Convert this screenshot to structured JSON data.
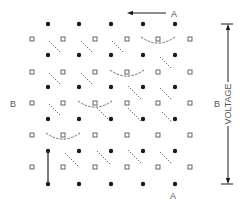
{
  "diagram": {
    "labels": {
      "top_arrow_label": "A",
      "bottom_label": "A",
      "left_label": "B",
      "right_label": "B",
      "voltage_label": "VOLTAGE"
    },
    "colors": {
      "ink": "#1a1a1a",
      "square_stroke": "#555555",
      "dash": "#555555",
      "label": "#555555"
    },
    "dots": {
      "xs": [
        48,
        79,
        111,
        143,
        175
      ],
      "ys": [
        24,
        55,
        87,
        119,
        151,
        184
      ]
    },
    "squares": {
      "xs": [
        32,
        63,
        95,
        127,
        158,
        190
      ],
      "ys": [
        39,
        72,
        103,
        135,
        167
      ]
    },
    "dashed_diagonals": [
      [
        49,
        41,
        61,
        53
      ],
      [
        81,
        41,
        93,
        53
      ],
      [
        112,
        41,
        124,
        53
      ],
      [
        160,
        57,
        172,
        69
      ],
      [
        49,
        73,
        61,
        85
      ],
      [
        81,
        73,
        93,
        85
      ],
      [
        128,
        86,
        142,
        100
      ],
      [
        160,
        88,
        172,
        100
      ],
      [
        49,
        104,
        61,
        116
      ],
      [
        97,
        108,
        111,
        122
      ],
      [
        128,
        108,
        142,
        122
      ],
      [
        162,
        112,
        172,
        122
      ],
      [
        65,
        153,
        79,
        167
      ],
      [
        97,
        151,
        111,
        165
      ],
      [
        128,
        150,
        142,
        164
      ],
      [
        160,
        152,
        172,
        164
      ]
    ],
    "arcs": [
      {
        "cx": 158,
        "cy": 38,
        "rx": 17,
        "ry": 7
      },
      {
        "cx": 127,
        "cy": 71,
        "rx": 17,
        "ry": 7
      },
      {
        "cx": 95,
        "cy": 102,
        "rx": 17,
        "ry": 7
      },
      {
        "cx": 63,
        "cy": 134,
        "rx": 17,
        "ry": 7
      }
    ],
    "top_arrow": {
      "x1": 166,
      "y1": 13,
      "x2": 127,
      "y2": 13,
      "label_x": 171,
      "label_y": 17
    },
    "bottom_label_pos": {
      "x": 173,
      "y": 199
    },
    "left_label_pos": {
      "x": 13,
      "y": 107
    },
    "right_label_pos": {
      "x": 217,
      "y": 107
    },
    "voltage_bar": {
      "x": 228,
      "y_top": 24,
      "y_bottom": 184,
      "label_y": 104
    },
    "solid_line": {
      "x": 48,
      "y1": 151,
      "y2": 184
    }
  }
}
